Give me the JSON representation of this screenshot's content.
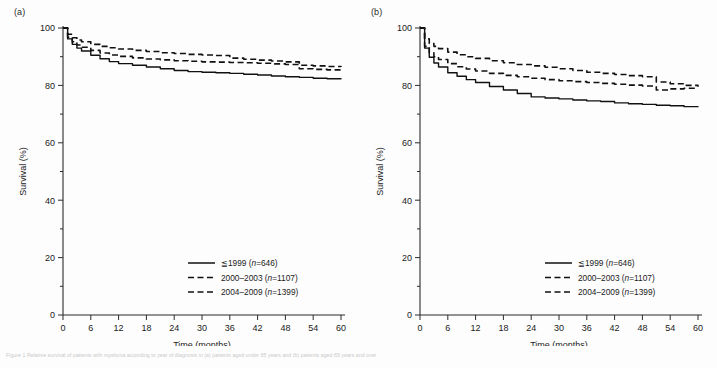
{
  "figure": {
    "caption": "Figure 1 Relative survival of patients with myeloma according to year of diagnosis in (a) patients aged under 65 years and (b) patients aged 65 years and over"
  },
  "panels": [
    {
      "id": "a",
      "label": "(a)",
      "chart_data": {
        "type": "line",
        "title": "",
        "xlabel": "Time (months)",
        "ylabel": "Survival (%)",
        "xlim": [
          0,
          60
        ],
        "ylim": [
          0,
          100
        ],
        "xticks": [
          0,
          6,
          12,
          18,
          24,
          30,
          36,
          42,
          48,
          54,
          60
        ],
        "yticks": [
          0,
          20,
          40,
          60,
          80,
          100
        ],
        "minor_y_step": 10,
        "grid": false,
        "legend_position": "lower-right",
        "x": [
          0,
          1,
          2,
          3,
          4,
          6,
          8,
          10,
          12,
          15,
          18,
          21,
          24,
          27,
          30,
          33,
          36,
          39,
          42,
          45,
          48,
          51,
          54,
          57,
          60
        ],
        "series": [
          {
            "name": "≦1999 (n=646)",
            "style": "solid",
            "values": [
              100.0,
              96.2,
              94.3,
              93.0,
              92.0,
              90.5,
              89.3,
              88.3,
              87.6,
              87.0,
              86.4,
              85.8,
              85.2,
              84.8,
              84.6,
              84.4,
              84.2,
              83.9,
              83.6,
              83.3,
              83.0,
              82.8,
              82.5,
              82.3,
              82.1
            ]
          },
          {
            "name": "2000–2003 (n=1107)",
            "style": "dashed",
            "values": [
              100.0,
              97.8,
              96.6,
              95.8,
              95.2,
              94.3,
              93.6,
              93.1,
              92.7,
              92.2,
              91.8,
              91.4,
              91.1,
              90.8,
              90.6,
              90.4,
              89.5,
              89.1,
              88.8,
              88.5,
              88.2,
              87.0,
              86.8,
              86.6,
              86.4
            ]
          },
          {
            "name": "2004–2009 (n=1399)",
            "style": "dashed",
            "values": [
              100.0,
              96.8,
              95.2,
              94.1,
              93.3,
              92.2,
              91.3,
              90.6,
              90.1,
              89.6,
              89.2,
              88.9,
              88.6,
              88.4,
              88.2,
              88.1,
              88.0,
              87.9,
              87.7,
              87.5,
              87.3,
              85.8,
              85.6,
              85.4,
              85.3
            ]
          }
        ]
      }
    },
    {
      "id": "b",
      "label": "(b)",
      "chart_data": {
        "type": "line",
        "title": "",
        "xlabel": "Time (months)",
        "ylabel": "Survival (%)",
        "xlim": [
          0,
          60
        ],
        "ylim": [
          0,
          100
        ],
        "xticks": [
          0,
          6,
          12,
          18,
          24,
          30,
          36,
          42,
          48,
          54,
          60
        ],
        "yticks": [
          0,
          20,
          40,
          60,
          80,
          100
        ],
        "minor_y_step": 10,
        "grid": false,
        "legend_position": "lower-right",
        "x": [
          0,
          1,
          2,
          3,
          4,
          6,
          8,
          10,
          12,
          15,
          18,
          21,
          24,
          27,
          30,
          33,
          36,
          39,
          42,
          45,
          48,
          51,
          54,
          57,
          60
        ],
        "series": [
          {
            "name": "≦1999 (n=646)",
            "style": "solid",
            "values": [
              100.0,
              93.0,
              89.8,
              87.8,
              86.4,
              84.4,
              83.2,
              82.0,
              81.0,
              79.6,
              78.4,
              77.2,
              76.0,
              75.6,
              75.3,
              74.9,
              74.6,
              74.4,
              73.9,
              73.6,
              73.4,
              73.1,
              72.9,
              72.6,
              72.4
            ]
          },
          {
            "name": "2000–2003 (n=1107)",
            "style": "dashed",
            "values": [
              100.0,
              96.2,
              94.6,
              93.6,
              92.8,
              91.6,
              90.7,
              90.0,
              89.4,
              88.6,
              87.9,
              87.3,
              86.8,
              86.3,
              85.8,
              85.2,
              84.6,
              84.2,
              83.8,
              83.4,
              83.0,
              81.2,
              80.6,
              80.0,
              79.5
            ]
          },
          {
            "name": "2004–2009 (n=1399)",
            "style": "dashed",
            "values": [
              100.0,
              93.6,
              91.4,
              90.0,
              89.0,
              87.6,
              86.5,
              85.7,
              85.0,
              84.2,
              83.5,
              83.0,
              82.5,
              82.0,
              81.6,
              81.3,
              81.0,
              80.7,
              80.4,
              80.1,
              79.8,
              78.4,
              78.8,
              79.0,
              79.1
            ]
          }
        ]
      }
    }
  ],
  "legend": {
    "entries": [
      {
        "label": "≦1999 (",
        "italic": "n",
        "tail": "=646)",
        "style": "solid"
      },
      {
        "label": "2000–2003 (",
        "italic": "n",
        "tail": "=1107)",
        "style": "dashed"
      },
      {
        "label": "2004–2009 (",
        "italic": "n",
        "tail": "=1399)",
        "style": "dashed"
      }
    ]
  },
  "colors": {
    "line": "#111111",
    "axis": "#2b2b2b",
    "background": "#fdfdfd"
  }
}
